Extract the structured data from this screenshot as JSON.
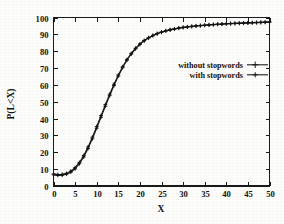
{
  "chart_data": {
    "type": "line",
    "title": "",
    "subtitle": "",
    "xlabel": "X",
    "ylabel": "P(L<X)",
    "xlim": [
      0,
      50
    ],
    "ylim": [
      0,
      100
    ],
    "xticks": [
      0,
      5,
      10,
      15,
      20,
      25,
      30,
      35,
      40,
      45,
      50
    ],
    "xticklabels": [
      "0",
      "5",
      "10",
      "15",
      "20",
      "25",
      "30",
      "35",
      "40",
      "45",
      "50"
    ],
    "yticks": [
      0,
      10,
      20,
      30,
      40,
      50,
      60,
      70,
      80,
      90,
      100
    ],
    "yticklabels": [
      "0",
      "10",
      "20",
      "30",
      "40",
      "50",
      "60",
      "70",
      "80",
      "90",
      "100"
    ],
    "grid": false,
    "legend_position": "upper right inside",
    "marker": "plus",
    "line_color": "#141414",
    "background_color": "#fdfdfc",
    "x": [
      0,
      1,
      2,
      3,
      4,
      5,
      6,
      7,
      8,
      9,
      10,
      11,
      12,
      13,
      14,
      15,
      16,
      17,
      18,
      19,
      20,
      21,
      22,
      23,
      24,
      25,
      26,
      27,
      28,
      29,
      30,
      31,
      32,
      33,
      34,
      35,
      36,
      37,
      38,
      39,
      40,
      41,
      42,
      43,
      44,
      45,
      46,
      47,
      48,
      49,
      50
    ],
    "series": [
      {
        "name": "without stopwords",
        "values": [
          6.6,
          6.3,
          6.4,
          7.0,
          8.2,
          10.2,
          13.2,
          17.2,
          22.2,
          28.0,
          34.3,
          40.8,
          47.3,
          53.6,
          59.6,
          65.2,
          70.2,
          74.6,
          78.3,
          81.4,
          84.0,
          86.1,
          87.8,
          89.2,
          90.3,
          91.2,
          92.0,
          92.6,
          93.1,
          93.6,
          94.0,
          94.3,
          94.6,
          94.9,
          95.1,
          95.3,
          95.5,
          95.7,
          95.9,
          96.0,
          96.2,
          96.3,
          96.4,
          96.5,
          96.6,
          96.7,
          96.8,
          96.9,
          97.0,
          97.1,
          97.2
        ]
      },
      {
        "name": "with stopwords",
        "values": [
          7.2,
          6.8,
          6.9,
          7.5,
          8.8,
          10.9,
          14.0,
          18.1,
          23.2,
          29.0,
          35.3,
          41.8,
          48.3,
          54.5,
          60.4,
          65.9,
          70.8,
          75.1,
          78.7,
          81.8,
          84.3,
          86.4,
          88.0,
          89.4,
          90.5,
          91.4,
          92.2,
          92.8,
          93.3,
          93.8,
          94.2,
          94.5,
          94.8,
          95.1,
          95.3,
          95.5,
          95.7,
          95.9,
          96.1,
          96.2,
          96.4,
          96.5,
          96.6,
          96.7,
          96.8,
          96.9,
          97.0,
          97.1,
          97.2,
          97.3,
          97.4
        ]
      }
    ]
  },
  "legend": {
    "entries": [
      {
        "label": "without stopwords"
      },
      {
        "label": "with stopwords"
      }
    ]
  },
  "axes": {
    "x_title": "X",
    "y_title": "P(L<X)"
  }
}
